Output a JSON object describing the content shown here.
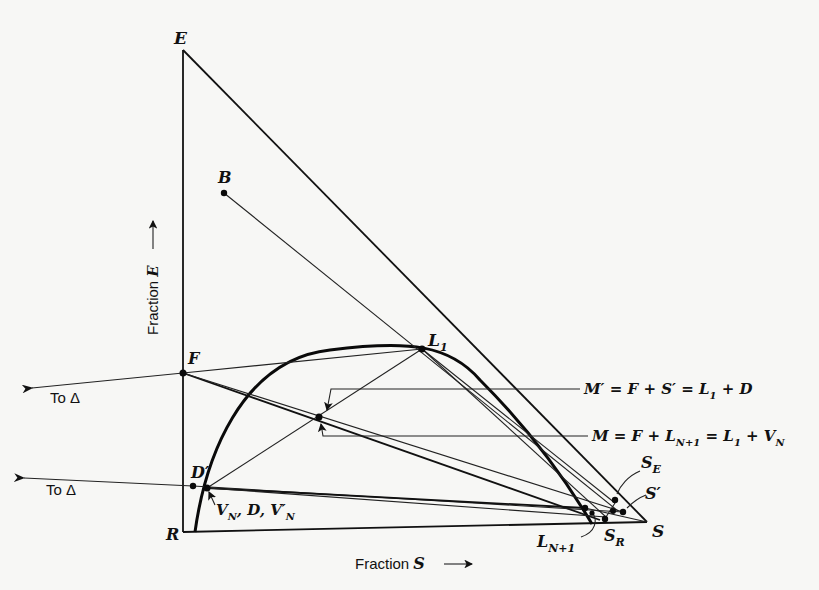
{
  "figure": {
    "type": "ternary extraction diagram (right-triangle coordinates)",
    "axes": {
      "y_label": "Fraction",
      "y_var": "E",
      "x_label": "Fraction",
      "x_var": "S"
    },
    "vertices": {
      "E": "E",
      "R": "R",
      "S": "S"
    },
    "points": {
      "B": "B",
      "F": "F",
      "D_prime": "D′",
      "L1_main": "L",
      "L1_sub": "1",
      "LN1_main": "L",
      "LN1_sub": "N+1",
      "SE_main": "S",
      "SE_sub": "E",
      "SR_main": "S",
      "SR_sub": "R",
      "S_prime": "S′"
    },
    "labels": {
      "to_delta_upper": "To Δ",
      "to_delta_lower": "To Δ",
      "vn_label_a": "V",
      "vn_label_a_sub": "N",
      "vn_label_b": ", D, V′",
      "vn_label_b_sub": "N",
      "m_prime_eq": "M′ = F + S′ = L",
      "m_prime_eq_sub": "1",
      "m_prime_eq_tail": " + D",
      "m_eq": "M = F + L",
      "m_eq_sub": "N+1",
      "m_eq_mid": " = L",
      "m_eq_sub2": "1",
      "m_eq_tail": " + V",
      "m_eq_sub3": "N"
    }
  }
}
